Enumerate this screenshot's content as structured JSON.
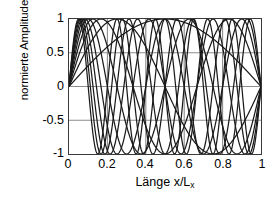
{
  "chart_data": {
    "type": "line",
    "title": "",
    "xlabel": "Länge  x/Lx",
    "xlabel_main": "Länge  x/L",
    "xlabel_sub": "x",
    "ylabel": "normierte Amplitude",
    "xlim": [
      0,
      1
    ],
    "ylim": [
      -1,
      1
    ],
    "xticks": [
      0,
      0.2,
      0.4,
      0.6,
      0.8,
      1
    ],
    "xticklabels": [
      "0",
      "0.2",
      "0.4",
      "0.6",
      "0.8",
      "1"
    ],
    "yticks": [
      -1,
      -0.5,
      0,
      0.5,
      1
    ],
    "yticklabels": [
      "-1",
      "-0.5",
      "0",
      "0.5",
      "1"
    ],
    "grid": true,
    "gridlines_x": [
      0.2,
      0.4,
      0.6,
      0.8
    ],
    "gridlines_y": [
      -0.5,
      0,
      0.5
    ],
    "legend": "none",
    "line_color": "#1a1a1a",
    "grid_color": "#8c8c8c",
    "axis_color": "#3a3a3a",
    "background": "#ffffff",
    "function": "sin(n*pi*x)",
    "series": [
      {
        "name": "Mode n=1",
        "n": 1,
        "amplitude": 1
      },
      {
        "name": "Mode n=2",
        "n": 2,
        "amplitude": 1
      },
      {
        "name": "Mode n=3",
        "n": 3,
        "amplitude": 1
      },
      {
        "name": "Mode n=4",
        "n": 4,
        "amplitude": 1
      },
      {
        "name": "Mode n=5",
        "n": 5,
        "amplitude": 1
      },
      {
        "name": "Mode n=6",
        "n": 6,
        "amplitude": 1
      },
      {
        "name": "Mode n=7",
        "n": 7,
        "amplitude": 1
      },
      {
        "name": "Mode n=8",
        "n": 8,
        "amplitude": 1
      },
      {
        "name": "Mode n=9",
        "n": 9,
        "amplitude": 1
      },
      {
        "name": "Mode n=10",
        "n": 10,
        "amplitude": 1
      }
    ]
  }
}
